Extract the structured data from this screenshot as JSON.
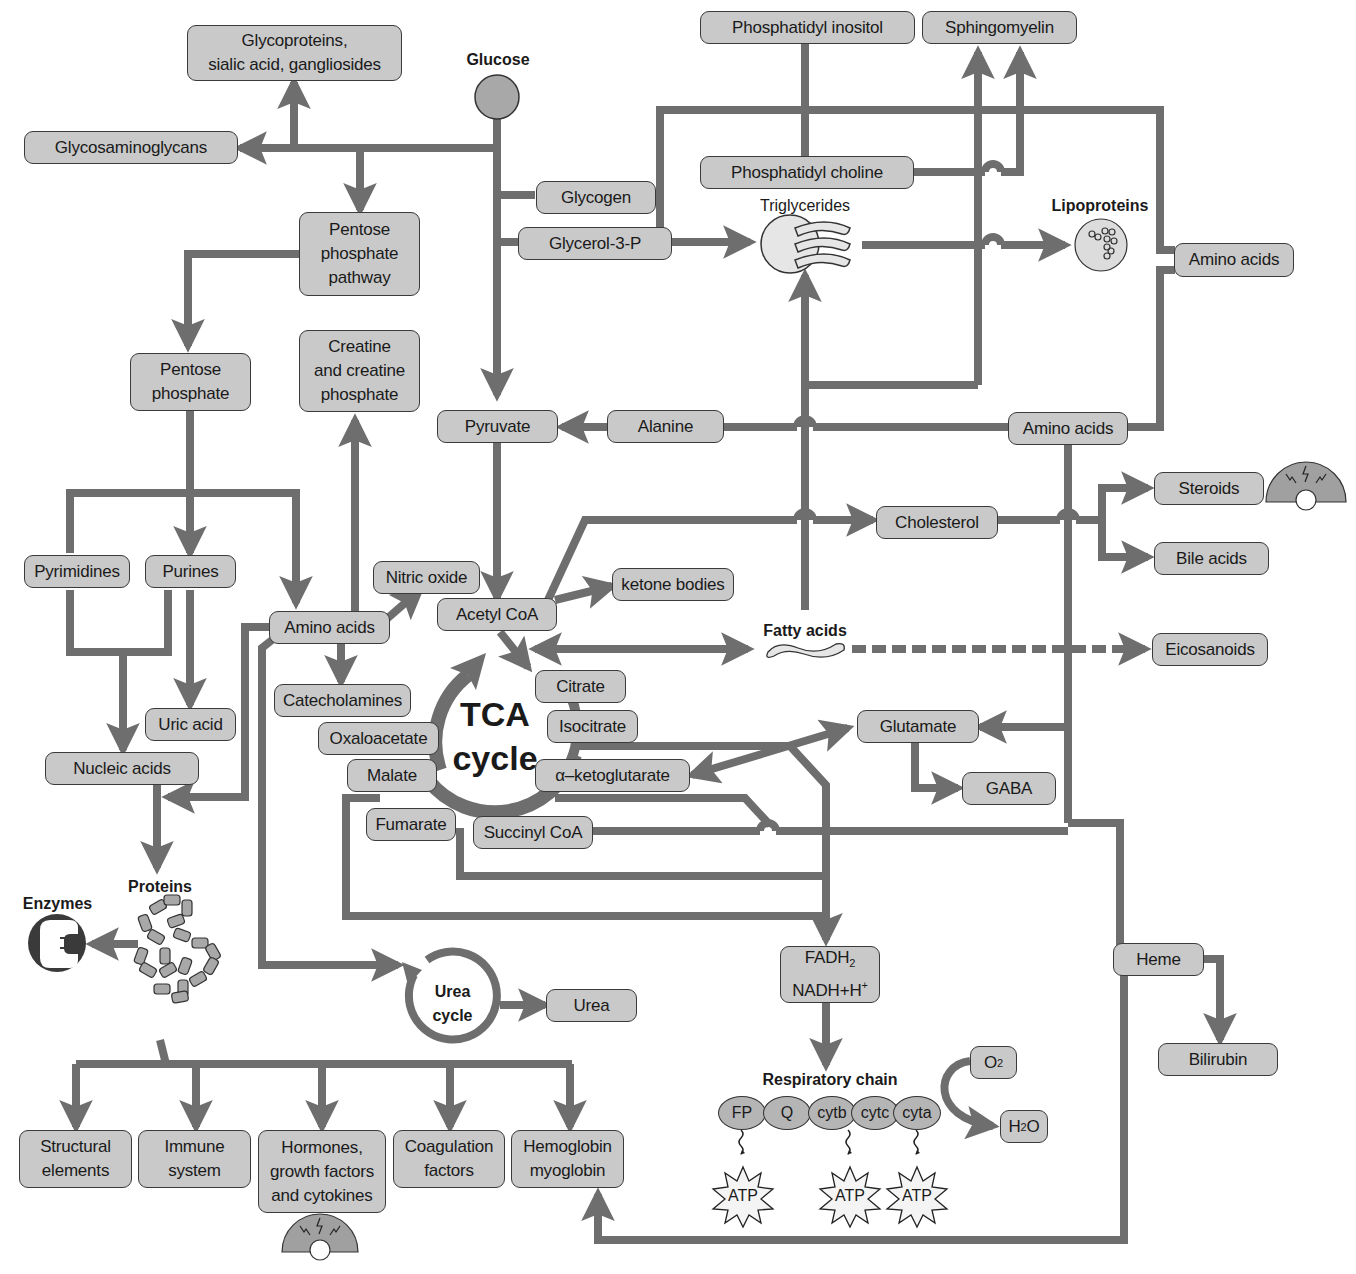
{
  "colors": {
    "line": "#6e6e6e",
    "box_fill": "#c9c9c9",
    "box_border": "#3a3a3a",
    "background": "#ffffff"
  },
  "nodes": {
    "glucose": "Glucose",
    "glycoproteins": "Glycoproteins,\nsialic acid, gangliosides",
    "glycosaminoglycans": "Glycosaminoglycans",
    "pentose_pathway": "Pentose\nphosphate\npathway",
    "pentose_phosphate": "Pentose\nphosphate",
    "creatine": "Creatine\nand creatine\nphosphate",
    "glycogen": "Glycogen",
    "glycerol3p": "Glycerol-3-P",
    "phosphatidyl_inositol": "Phosphatidyl inositol",
    "sphingomyelin": "Sphingomyelin",
    "phosphatidyl_choline": "Phosphatidyl choline",
    "triglycerides": "Triglycerides",
    "lipoproteins": "Lipoproteins",
    "amino_acids_right": "Amino acids",
    "pyruvate": "Pyruvate",
    "alanine": "Alanine",
    "amino_acids_mid": "Amino acids",
    "cholesterol": "Cholesterol",
    "steroids": "Steroids",
    "bile_acids": "Bile acids",
    "pyrimidines": "Pyrimidines",
    "purines": "Purines",
    "amino_acids_left": "Amino acids",
    "nitric_oxide": "Nitric oxide",
    "acetyl_coa": "Acetyl CoA",
    "ketone_bodies": "ketone bodies",
    "fatty_acids": "Fatty acids",
    "eicosanoids": "Eicosanoids",
    "catecholamines": "Catecholamines",
    "citrate": "Citrate",
    "isocitrate": "Isocitrate",
    "oxaloacetate": "Oxaloacetate",
    "malate": "Malate",
    "alpha_kg": "α–ketoglutarate",
    "fumarate": "Fumarate",
    "succinyl_coa": "Succinyl CoA",
    "glutamate": "Glutamate",
    "gaba": "GABA",
    "uric_acid": "Uric acid",
    "nucleic_acids": "Nucleic acids",
    "tca_cycle": "TCA\ncycle",
    "proteins": "Proteins",
    "enzymes": "Enzymes",
    "urea_cycle": "Urea\ncycle",
    "urea": "Urea",
    "fadh2": "FADH",
    "fadh2_sub": "2",
    "nadh": "NADH+H",
    "nadh_sup": "+",
    "heme": "Heme",
    "bilirubin": "Bilirubin",
    "respiratory_chain": "Respiratory chain",
    "o2": "O",
    "o2_sub": "2",
    "h2o_h": "H",
    "h2o_sub": "2",
    "h2o_o": "O",
    "structural": "Structural\nelements",
    "immune": "Immune\nsystem",
    "hormones": "Hormones,\ngrowth factors\nand cytokines",
    "coagulation": "Coagulation\nfactors",
    "hemoglobin": "Hemoglobin\nmyoglobin"
  },
  "respiratory_chain_complexes": [
    "FP",
    "Q",
    "cytb",
    "cytc",
    "cyta"
  ],
  "atp_label": "ATP"
}
